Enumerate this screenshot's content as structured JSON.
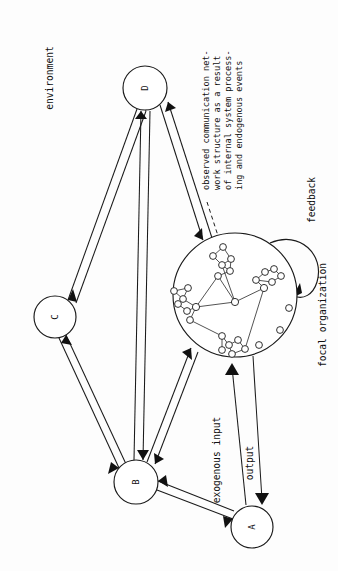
{
  "figure": {
    "type": "network-systems-diagram",
    "orientation": "rotated-90-ccw",
    "background_color": "#fdfdfd",
    "line_color": "#1a1a1a"
  },
  "nodes": [
    {
      "id": "A",
      "label": "A",
      "cx": 252,
      "cy": 527,
      "r": 21
    },
    {
      "id": "B",
      "label": "B",
      "cx": 136,
      "cy": 482,
      "r": 22
    },
    {
      "id": "C",
      "label": "C",
      "cx": 55,
      "cy": 317,
      "r": 21
    },
    {
      "id": "D",
      "label": "D",
      "cx": 145,
      "cy": 88,
      "r": 22
    }
  ],
  "focal": {
    "label": "focal organization",
    "cx": 235,
    "cy": 295,
    "r": 62
  },
  "labels": {
    "environment": "environment",
    "feedback": "feedback",
    "focal_organization": "focal organization",
    "exogenous_input": "exogenous input",
    "output": "output"
  },
  "annotation": {
    "lines": [
      "observed communication net-",
      "work structure as a result",
      "of internal system process-",
      "ing and endogenous events"
    ]
  },
  "edges": [
    {
      "from": "C",
      "to": "D",
      "kind": "bidirectional"
    },
    {
      "from": "B",
      "to": "D",
      "kind": "bidirectional"
    },
    {
      "from": "B",
      "to": "C",
      "kind": "bidirectional"
    },
    {
      "from": "B",
      "to": "A",
      "kind": "bidirectional"
    },
    {
      "from": "B",
      "to": "focal",
      "kind": "bidirectional"
    },
    {
      "from": "D",
      "to": "focal",
      "kind": "bidirectional"
    },
    {
      "from": "A",
      "to": "focal",
      "kind": "exogenous-input"
    },
    {
      "from": "focal",
      "to": "A",
      "kind": "output"
    },
    {
      "from": "focal",
      "to": "focal",
      "kind": "feedback-loop"
    },
    {
      "from": "annotation",
      "to": "focal",
      "kind": "dashed-pointer"
    }
  ],
  "micro_network": {
    "nodes": [
      {
        "x": 213,
        "y": 256
      },
      {
        "x": 223,
        "y": 247
      },
      {
        "x": 231,
        "y": 259
      },
      {
        "x": 222,
        "y": 265
      },
      {
        "x": 230,
        "y": 271
      },
      {
        "x": 218,
        "y": 276
      },
      {
        "x": 235,
        "y": 302
      },
      {
        "x": 183,
        "y": 299
      },
      {
        "x": 174,
        "y": 291
      },
      {
        "x": 188,
        "y": 288
      },
      {
        "x": 178,
        "y": 304
      },
      {
        "x": 187,
        "y": 311
      },
      {
        "x": 196,
        "y": 307
      },
      {
        "x": 190,
        "y": 320
      },
      {
        "x": 256,
        "y": 280
      },
      {
        "x": 265,
        "y": 272
      },
      {
        "x": 274,
        "y": 269
      },
      {
        "x": 281,
        "y": 276
      },
      {
        "x": 272,
        "y": 282
      },
      {
        "x": 264,
        "y": 288
      },
      {
        "x": 222,
        "y": 336
      },
      {
        "x": 229,
        "y": 345
      },
      {
        "x": 238,
        "y": 340
      },
      {
        "x": 245,
        "y": 349
      },
      {
        "x": 232,
        "y": 354
      },
      {
        "x": 222,
        "y": 350
      },
      {
        "x": 289,
        "y": 308
      },
      {
        "x": 280,
        "y": 330
      },
      {
        "x": 259,
        "y": 345
      }
    ],
    "edges": [
      [
        0,
        1
      ],
      [
        1,
        2
      ],
      [
        2,
        3
      ],
      [
        3,
        4
      ],
      [
        4,
        5
      ],
      [
        0,
        3
      ],
      [
        2,
        4
      ],
      [
        3,
        6
      ],
      [
        6,
        12
      ],
      [
        6,
        19
      ],
      [
        7,
        8
      ],
      [
        8,
        9
      ],
      [
        7,
        9
      ],
      [
        7,
        10
      ],
      [
        10,
        11
      ],
      [
        11,
        12
      ],
      [
        7,
        12
      ],
      [
        12,
        6
      ],
      [
        12,
        13
      ],
      [
        13,
        20
      ],
      [
        14,
        15
      ],
      [
        15,
        16
      ],
      [
        16,
        17
      ],
      [
        17,
        18
      ],
      [
        18,
        14
      ],
      [
        14,
        19
      ],
      [
        19,
        6
      ],
      [
        20,
        21
      ],
      [
        21,
        22
      ],
      [
        22,
        23
      ],
      [
        23,
        24
      ],
      [
        24,
        21
      ],
      [
        20,
        25
      ],
      [
        19,
        23
      ],
      [
        5,
        12
      ]
    ],
    "isolated_nodes": [
      26,
      27,
      28
    ]
  }
}
